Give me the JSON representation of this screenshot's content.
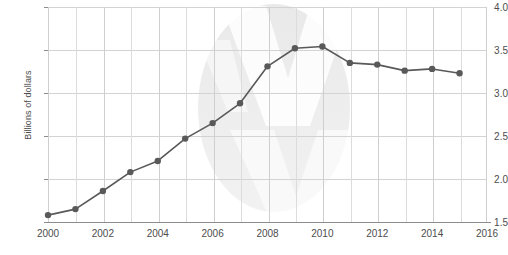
{
  "chart_data": {
    "type": "line",
    "title": "",
    "xlabel": "",
    "ylabel": "Billions of dollars",
    "x": [
      2000,
      2001,
      2002,
      2003,
      2004,
      2005,
      2006,
      2007,
      2008,
      2009,
      2010,
      2011,
      2012,
      2013,
      2014,
      2015
    ],
    "values": [
      1.58,
      1.65,
      1.86,
      2.08,
      2.21,
      2.47,
      2.65,
      2.88,
      3.31,
      3.52,
      3.54,
      3.35,
      3.33,
      3.26,
      3.28,
      3.23
    ],
    "series": [
      {
        "name": "Billions of dollars",
        "values": [
          1.58,
          1.65,
          1.86,
          2.08,
          2.21,
          2.47,
          2.65,
          2.88,
          3.31,
          3.52,
          3.54,
          3.35,
          3.33,
          3.26,
          3.28,
          3.23
        ]
      }
    ],
    "xlim": [
      2000,
      2016
    ],
    "ylim": [
      1.5,
      4.0
    ],
    "ytick_labels": [
      "1.5",
      "2.0",
      "2.5",
      "3.0",
      "3.5",
      "4.0"
    ],
    "ytick_values": [
      1.5,
      2.0,
      2.5,
      3.0,
      3.5,
      4.0
    ],
    "xtick_labels": [
      "2000",
      "2002",
      "2004",
      "2006",
      "2008",
      "2010",
      "2012",
      "2014",
      "2016"
    ],
    "xtick_values": [
      2000,
      2002,
      2004,
      2006,
      2008,
      2010,
      2012,
      2014,
      2016
    ],
    "minor_x_gridlines": [
      2001,
      2003,
      2005,
      2007,
      2009,
      2011,
      2013,
      2015
    ],
    "grid": true,
    "legend": "none",
    "line_color": "#595959",
    "marker_color": "#595959",
    "grid_color": "#d3d3d3",
    "axis_color": "#8c8c8c",
    "text_color": "#4d4d4d",
    "background": "#ffffff",
    "marker": "circle",
    "marker_size": 3.2,
    "line_width": 1.6
  }
}
